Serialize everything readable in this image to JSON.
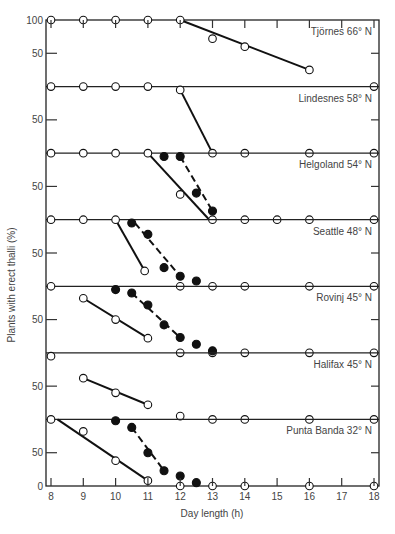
{
  "chart_data": {
    "type": "line",
    "layout": "stacked-panels",
    "xlabel": "Day length (h)",
    "ylabel": "Plants with erect thalli (%)",
    "xlim": [
      8,
      18
    ],
    "ylim": [
      0,
      100
    ],
    "x_ticks": [
      8,
      9,
      10,
      11,
      12,
      13,
      14,
      15,
      16,
      17,
      18
    ],
    "y_ticks": [
      0,
      50,
      100
    ],
    "grid": false,
    "legend": "none (series distinguished by open circles/solid line vs filled circles/dashed line)",
    "panels": [
      {
        "label": "Tjörnes 66° N",
        "series": [
          {
            "name": "open",
            "marker": "open-circle",
            "line": "solid",
            "points": [
              [
                8,
                100
              ],
              [
                9,
                100
              ],
              [
                10,
                100
              ],
              [
                11,
                100
              ],
              [
                12,
                100
              ],
              [
                13,
                72
              ],
              [
                14,
                60
              ],
              [
                16,
                25
              ],
              [
                18,
                0
              ]
            ],
            "fit": [
              [
                12,
                100
              ],
              [
                16,
                25
              ]
            ]
          }
        ]
      },
      {
        "label": "Lindesnes 58° N",
        "series": [
          {
            "name": "open",
            "marker": "open-circle",
            "line": "solid",
            "points": [
              [
                8,
                100
              ],
              [
                9,
                100
              ],
              [
                10,
                100
              ],
              [
                11,
                100
              ],
              [
                12,
                95
              ],
              [
                13,
                0
              ],
              [
                14,
                0
              ],
              [
                16,
                0
              ],
              [
                18,
                0
              ]
            ],
            "fit": [
              [
                12,
                95
              ],
              [
                13,
                0
              ]
            ]
          }
        ]
      },
      {
        "label": "Helgoland 54° N",
        "series": [
          {
            "name": "open",
            "marker": "open-circle",
            "line": "solid",
            "points": [
              [
                8,
                100
              ],
              [
                9,
                100
              ],
              [
                10,
                100
              ],
              [
                11,
                100
              ],
              [
                12,
                38
              ],
              [
                13,
                0
              ],
              [
                14,
                0
              ],
              [
                15,
                0
              ],
              [
                16,
                0
              ],
              [
                18,
                0
              ]
            ],
            "fit": [
              [
                11,
                100
              ],
              [
                12.9,
                0
              ]
            ]
          },
          {
            "name": "filled",
            "marker": "filled-circle",
            "line": "dashed",
            "points": [
              [
                11.5,
                95
              ],
              [
                12,
                95
              ],
              [
                12.5,
                40
              ],
              [
                13,
                13
              ]
            ],
            "fit": [
              [
                12,
                95
              ],
              [
                13,
                13
              ]
            ]
          }
        ]
      },
      {
        "label": "Seattle 48° N",
        "series": [
          {
            "name": "open",
            "marker": "open-circle",
            "line": "solid",
            "points": [
              [
                8,
                100
              ],
              [
                9,
                100
              ],
              [
                10,
                100
              ],
              [
                10.9,
                23
              ],
              [
                12,
                0
              ],
              [
                13,
                0
              ],
              [
                14,
                0
              ],
              [
                16,
                0
              ],
              [
                18,
                0
              ]
            ],
            "fit": [
              [
                10,
                100
              ],
              [
                10.9,
                23
              ]
            ]
          },
          {
            "name": "filled",
            "marker": "filled-circle",
            "line": "dashed",
            "points": [
              [
                10.5,
                95
              ],
              [
                11,
                78
              ],
              [
                11.5,
                28
              ],
              [
                12,
                15
              ],
              [
                12.5,
                8
              ]
            ],
            "fit": [
              [
                10.6,
                95
              ],
              [
                12,
                15
              ]
            ]
          }
        ]
      },
      {
        "label": "Rovinj 45° N",
        "series": [
          {
            "name": "open",
            "marker": "open-circle",
            "line": "solid",
            "points": [
              [
                8,
                100
              ],
              [
                9,
                82
              ],
              [
                10,
                50
              ],
              [
                11,
                22
              ],
              [
                12,
                0
              ],
              [
                13,
                0
              ],
              [
                14,
                0
              ],
              [
                16,
                0
              ],
              [
                18,
                0
              ]
            ],
            "fit": [
              [
                9,
                82
              ],
              [
                11,
                22
              ]
            ]
          },
          {
            "name": "filled",
            "marker": "filled-circle",
            "line": "dashed",
            "points": [
              [
                10,
                95
              ],
              [
                10.5,
                90
              ],
              [
                11,
                72
              ],
              [
                11.5,
                42
              ],
              [
                12,
                23
              ],
              [
                12.5,
                13
              ],
              [
                13,
                3
              ]
            ],
            "fit": [
              [
                10.5,
                90
              ],
              [
                12,
                23
              ]
            ]
          }
        ]
      },
      {
        "label": "Halifax 45° N",
        "series": [
          {
            "name": "open",
            "marker": "open-circle",
            "line": "solid",
            "points": [
              [
                8,
                95
              ],
              [
                9,
                62
              ],
              [
                10,
                40
              ],
              [
                11,
                22
              ],
              [
                12,
                5
              ],
              [
                13,
                0
              ],
              [
                14,
                0
              ],
              [
                16,
                0
              ],
              [
                18,
                0
              ]
            ],
            "fit": [
              [
                9,
                62
              ],
              [
                11,
                22
              ]
            ]
          }
        ]
      },
      {
        "label": "Punta Banda 32° N",
        "series": [
          {
            "name": "open",
            "marker": "open-circle",
            "line": "solid",
            "points": [
              [
                8,
                100
              ],
              [
                9,
                82
              ],
              [
                10,
                38
              ],
              [
                11,
                8
              ],
              [
                12,
                0
              ],
              [
                13,
                0
              ],
              [
                14,
                0
              ],
              [
                16,
                0
              ],
              [
                18,
                0
              ]
            ],
            "fit": [
              [
                8.2,
                100
              ],
              [
                11,
                8
              ]
            ]
          },
          {
            "name": "filled",
            "marker": "filled-circle",
            "line": "dashed",
            "points": [
              [
                10,
                98
              ],
              [
                10.5,
                88
              ],
              [
                11,
                50
              ],
              [
                11.5,
                23
              ],
              [
                12,
                15
              ],
              [
                12.5,
                5
              ]
            ],
            "fit": [
              [
                10.5,
                88
              ],
              [
                11.5,
                23
              ]
            ]
          }
        ]
      }
    ]
  },
  "axis": {
    "xlabel": "Day length (h)",
    "ylabel": "Plants with erect thalli (%)",
    "x_tick_labels": [
      "8",
      "9",
      "10",
      "11",
      "12",
      "13",
      "14",
      "15",
      "16",
      "17",
      "18"
    ],
    "y_top_label": "100",
    "y_mid_label": "50",
    "y_bottom_label": "0"
  }
}
